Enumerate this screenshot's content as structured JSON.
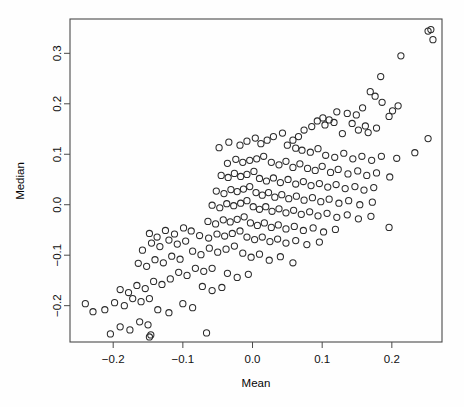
{
  "chart_data": {
    "type": "scatter",
    "title": "",
    "xlabel": "Mean",
    "ylabel": "Median",
    "xlim": [
      -0.262,
      0.272
    ],
    "ylim": [
      -0.272,
      0.368
    ],
    "grid": false,
    "legend": null,
    "marker": {
      "shape": "open-circle",
      "radius": 3.1,
      "stroke_color": "#2b2b2b",
      "fill": "none"
    },
    "xticks": [
      -0.2,
      -0.1,
      0.0,
      0.1,
      0.2
    ],
    "xtick_labels": [
      "-0.2",
      "-0.1",
      "0.0",
      "0.1",
      "0.2"
    ],
    "yticks": [
      -0.2,
      -0.1,
      0.0,
      0.1,
      0.2,
      0.3
    ],
    "ytick_labels": [
      "-0.2",
      "-0.1",
      "0.0",
      "0.1",
      "0.2",
      "0.3"
    ],
    "n_points": 204,
    "correlation_note": "strong positive association between Mean and Median",
    "points": [
      [
        0.252,
        0.344
      ],
      [
        0.256,
        0.347
      ],
      [
        0.259,
        0.327
      ],
      [
        0.213,
        0.295
      ],
      [
        0.184,
        0.254
      ],
      [
        0.169,
        0.224
      ],
      [
        0.176,
        0.215
      ],
      [
        0.186,
        0.203
      ],
      [
        0.209,
        0.196
      ],
      [
        0.158,
        0.192
      ],
      [
        0.201,
        0.186
      ],
      [
        0.196,
        0.175
      ],
      [
        0.121,
        0.184
      ],
      [
        0.136,
        0.181
      ],
      [
        0.149,
        0.178
      ],
      [
        0.11,
        0.168
      ],
      [
        0.101,
        0.172
      ],
      [
        0.093,
        0.166
      ],
      [
        0.104,
        0.158
      ],
      [
        0.117,
        0.163
      ],
      [
        0.143,
        0.161
      ],
      [
        0.162,
        0.156
      ],
      [
        0.178,
        0.152
      ],
      [
        0.152,
        0.148
      ],
      [
        0.166,
        0.143
      ],
      [
        0.129,
        0.141
      ],
      [
        0.085,
        0.155
      ],
      [
        0.074,
        0.148
      ],
      [
        0.066,
        0.135
      ],
      [
        0.058,
        0.128
      ],
      [
        0.043,
        0.142
      ],
      [
        0.03,
        0.135
      ],
      [
        0.021,
        0.128
      ],
      [
        0.012,
        0.121
      ],
      [
        0.004,
        0.132
      ],
      [
        -0.008,
        0.126
      ],
      [
        -0.018,
        0.118
      ],
      [
        -0.034,
        0.124
      ],
      [
        -0.048,
        0.113
      ],
      [
        0.05,
        0.118
      ],
      [
        0.062,
        0.112
      ],
      [
        0.071,
        0.108
      ],
      [
        0.083,
        0.104
      ],
      [
        0.094,
        0.111
      ],
      [
        0.105,
        0.098
      ],
      [
        0.118,
        0.094
      ],
      [
        0.131,
        0.102
      ],
      [
        0.144,
        0.091
      ],
      [
        0.157,
        0.096
      ],
      [
        0.171,
        0.088
      ],
      [
        0.185,
        0.096
      ],
      [
        0.207,
        0.092
      ],
      [
        0.233,
        0.103
      ],
      [
        0.252,
        0.131
      ],
      [
        0.016,
        0.096
      ],
      [
        0.006,
        0.091
      ],
      [
        -0.004,
        0.088
      ],
      [
        -0.014,
        0.084
      ],
      [
        -0.024,
        0.09
      ],
      [
        -0.036,
        0.082
      ],
      [
        0.027,
        0.084
      ],
      [
        0.038,
        0.079
      ],
      [
        0.048,
        0.086
      ],
      [
        0.058,
        0.074
      ],
      [
        0.068,
        0.081
      ],
      [
        0.079,
        0.072
      ],
      [
        0.09,
        0.068
      ],
      [
        0.1,
        0.076
      ],
      [
        0.112,
        0.064
      ],
      [
        0.123,
        0.07
      ],
      [
        0.137,
        0.061
      ],
      [
        0.151,
        0.067
      ],
      [
        0.164,
        0.058
      ],
      [
        0.178,
        0.063
      ],
      [
        0.197,
        0.055
      ],
      [
        0.002,
        0.066
      ],
      [
        -0.008,
        0.06
      ],
      [
        -0.017,
        0.056
      ],
      [
        -0.026,
        0.062
      ],
      [
        -0.035,
        0.054
      ],
      [
        -0.045,
        0.058
      ],
      [
        0.01,
        0.052
      ],
      [
        0.02,
        0.047
      ],
      [
        0.03,
        0.053
      ],
      [
        0.04,
        0.044
      ],
      [
        0.051,
        0.05
      ],
      [
        0.062,
        0.041
      ],
      [
        0.073,
        0.046
      ],
      [
        0.084,
        0.038
      ],
      [
        0.096,
        0.042
      ],
      [
        0.108,
        0.035
      ],
      [
        0.12,
        0.04
      ],
      [
        0.133,
        0.032
      ],
      [
        0.147,
        0.036
      ],
      [
        0.16,
        0.029
      ],
      [
        0.174,
        0.034
      ],
      [
        -0.004,
        0.036
      ],
      [
        -0.013,
        0.031
      ],
      [
        -0.022,
        0.026
      ],
      [
        -0.031,
        0.03
      ],
      [
        -0.041,
        0.022
      ],
      [
        -0.052,
        0.027
      ],
      [
        0.005,
        0.024
      ],
      [
        0.014,
        0.019
      ],
      [
        0.023,
        0.024
      ],
      [
        0.032,
        0.015
      ],
      [
        0.042,
        0.02
      ],
      [
        0.052,
        0.012
      ],
      [
        0.063,
        0.017
      ],
      [
        0.074,
        0.009
      ],
      [
        0.086,
        0.014
      ],
      [
        0.098,
        0.006
      ],
      [
        0.11,
        0.011
      ],
      [
        0.124,
        0.003
      ],
      [
        0.138,
        0.008
      ],
      [
        0.154,
        0.0
      ],
      [
        0.172,
        0.005
      ],
      [
        -0.008,
        0.008
      ],
      [
        -0.017,
        0.003
      ],
      [
        -0.027,
        -0.002
      ],
      [
        -0.037,
        0.002
      ],
      [
        -0.047,
        -0.006
      ],
      [
        -0.058,
        -0.001
      ],
      [
        0.001,
        -0.004
      ],
      [
        0.01,
        -0.009
      ],
      [
        0.019,
        -0.004
      ],
      [
        0.028,
        -0.013
      ],
      [
        0.038,
        -0.008
      ],
      [
        0.048,
        -0.016
      ],
      [
        0.059,
        -0.011
      ],
      [
        0.07,
        -0.019
      ],
      [
        0.082,
        -0.014
      ],
      [
        0.094,
        -0.022
      ],
      [
        0.107,
        -0.017
      ],
      [
        0.121,
        -0.025
      ],
      [
        0.136,
        -0.02
      ],
      [
        0.152,
        -0.028
      ],
      [
        0.17,
        -0.023
      ],
      [
        -0.012,
        -0.024
      ],
      [
        -0.022,
        -0.029
      ],
      [
        -0.032,
        -0.034
      ],
      [
        -0.042,
        -0.03
      ],
      [
        -0.053,
        -0.038
      ],
      [
        -0.064,
        -0.033
      ],
      [
        -0.003,
        -0.036
      ],
      [
        0.007,
        -0.041
      ],
      [
        0.017,
        -0.036
      ],
      [
        0.027,
        -0.045
      ],
      [
        0.037,
        -0.04
      ],
      [
        0.048,
        -0.048
      ],
      [
        0.06,
        -0.043
      ],
      [
        0.073,
        -0.051
      ],
      [
        0.087,
        -0.046
      ],
      [
        0.102,
        -0.054
      ],
      [
        0.119,
        -0.049
      ],
      [
        0.196,
        -0.045
      ],
      [
        -0.018,
        -0.052
      ],
      [
        -0.029,
        -0.057
      ],
      [
        -0.04,
        -0.062
      ],
      [
        -0.051,
        -0.058
      ],
      [
        -0.063,
        -0.066
      ],
      [
        -0.076,
        -0.061
      ],
      [
        -0.008,
        -0.064
      ],
      [
        0.003,
        -0.069
      ],
      [
        0.014,
        -0.064
      ],
      [
        0.025,
        -0.073
      ],
      [
        0.036,
        -0.068
      ],
      [
        0.048,
        -0.076
      ],
      [
        0.062,
        -0.071
      ],
      [
        0.078,
        -0.079
      ],
      [
        0.096,
        -0.074
      ],
      [
        -0.088,
        -0.052
      ],
      [
        -0.099,
        -0.046
      ],
      [
        -0.112,
        -0.058
      ],
      [
        -0.125,
        -0.051
      ],
      [
        -0.137,
        -0.064
      ],
      [
        -0.148,
        -0.057
      ],
      [
        -0.096,
        -0.072
      ],
      [
        -0.108,
        -0.078
      ],
      [
        -0.12,
        -0.07
      ],
      [
        -0.133,
        -0.083
      ],
      [
        -0.145,
        -0.076
      ],
      [
        -0.158,
        -0.09
      ],
      [
        -0.026,
        -0.082
      ],
      [
        -0.038,
        -0.088
      ],
      [
        -0.05,
        -0.094
      ],
      [
        -0.062,
        -0.086
      ],
      [
        -0.074,
        -0.099
      ],
      [
        -0.086,
        -0.092
      ],
      [
        -0.014,
        -0.096
      ],
      [
        -0.002,
        -0.104
      ],
      [
        0.01,
        -0.098
      ],
      [
        0.024,
        -0.11
      ],
      [
        0.04,
        -0.103
      ],
      [
        0.058,
        -0.115
      ],
      [
        -0.104,
        -0.108
      ],
      [
        -0.116,
        -0.102
      ],
      [
        -0.128,
        -0.115
      ],
      [
        -0.14,
        -0.109
      ],
      [
        -0.152,
        -0.122
      ],
      [
        -0.164,
        -0.116
      ],
      [
        -0.058,
        -0.126
      ],
      [
        -0.07,
        -0.132
      ],
      [
        -0.082,
        -0.126
      ],
      [
        -0.094,
        -0.14
      ],
      [
        -0.106,
        -0.134
      ],
      [
        -0.118,
        -0.147
      ],
      [
        -0.036,
        -0.136
      ],
      [
        -0.022,
        -0.144
      ],
      [
        -0.006,
        -0.138
      ],
      [
        -0.13,
        -0.158
      ],
      [
        -0.142,
        -0.152
      ],
      [
        -0.154,
        -0.166
      ],
      [
        -0.166,
        -0.16
      ],
      [
        -0.178,
        -0.174
      ],
      [
        -0.19,
        -0.168
      ],
      [
        -0.072,
        -0.162
      ],
      [
        -0.058,
        -0.17
      ],
      [
        -0.044,
        -0.164
      ],
      [
        -0.148,
        -0.186
      ],
      [
        -0.16,
        -0.192
      ],
      [
        -0.172,
        -0.186
      ],
      [
        -0.184,
        -0.2
      ],
      [
        -0.198,
        -0.194
      ],
      [
        -0.212,
        -0.208
      ],
      [
        -0.24,
        -0.196
      ],
      [
        -0.229,
        -0.212
      ],
      [
        -0.1,
        -0.196
      ],
      [
        -0.086,
        -0.204
      ],
      [
        -0.12,
        -0.214
      ],
      [
        -0.136,
        -0.208
      ],
      [
        -0.15,
        -0.238
      ],
      [
        -0.162,
        -0.232
      ],
      [
        -0.176,
        -0.248
      ],
      [
        -0.19,
        -0.242
      ],
      [
        -0.204,
        -0.256
      ],
      [
        -0.148,
        -0.262
      ],
      [
        -0.146,
        -0.258
      ],
      [
        -0.066,
        -0.254
      ]
    ]
  }
}
